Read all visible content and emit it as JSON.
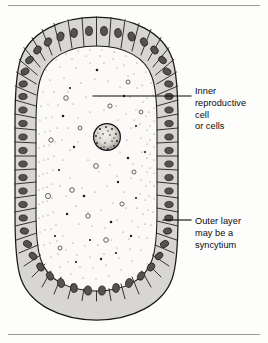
{
  "figure": {
    "kind": "biological-cross-section-diagram",
    "background_color": "#fdfdfc",
    "ink_color": "#0a0a0a",
    "cell_fill_color": "#d8d6d2",
    "nucleus_color": "#4a4845",
    "interior_fill_color": "#fbfaf8",
    "rules": {
      "top_present": true,
      "bottom_present": true,
      "color": "#9a9a96"
    },
    "body": {
      "shape": "rounded-oval capsule",
      "left": 15,
      "top": 17,
      "right": 178,
      "bottom": 320,
      "outer_cell_count": 40
    },
    "inner_cell": {
      "center_x": 107,
      "center_y": 137,
      "diameter": 27,
      "texture": "stippled granular"
    }
  },
  "annotations": [
    {
      "id": "inner-reproductive-cell",
      "text": "Inner\nreproductive\ncell\nor cells",
      "leader": {
        "x1": 93,
        "y1": 96,
        "x2": 191,
        "y2": 96
      }
    },
    {
      "id": "outer-layer-syncytium",
      "text": "Outer layer\nmay be a\nsyncytium",
      "leader": {
        "x1": 163,
        "y1": 220,
        "x2": 191,
        "y2": 220
      }
    }
  ]
}
